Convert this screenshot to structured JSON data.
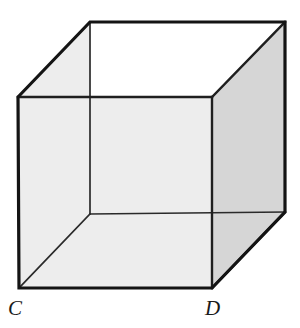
{
  "figure": {
    "name": "transparent-cube-diagram",
    "type": "line-drawing",
    "background_color": "#ffffff",
    "stroke_color": "#1a1a1a",
    "outer_stroke_width": 3,
    "inner_stroke_width": 1.6,
    "faces": {
      "top_face_color": "#ffffff",
      "left_face_color": "#ededed",
      "front_face_color": "#ededed",
      "right_face_color": "#d6d6d6"
    },
    "vertices": {
      "front_top_left": [
        18,
        97
      ],
      "front_top_right": [
        212,
        97
      ],
      "front_bottom_left": [
        19,
        288
      ],
      "front_bottom_right": [
        212,
        288
      ],
      "back_top_left": [
        90,
        22
      ],
      "back_top_right": [
        285,
        22
      ],
      "back_bottom_left": [
        90,
        214
      ],
      "back_bottom_right": [
        285,
        212
      ]
    },
    "outline_path": "M18,97 L90,22 L285,22 L285,212 L212,288 L19,288 Z",
    "right_face_path": "M212,97 L285,22 L285,212 L212,288 Z",
    "left_face_path": "M18,97 L90,22 L90,214 L19,288 Z",
    "front_face_path": "M18,97 L212,97 L212,288 L19,288 Z",
    "top_face_path": "M18,97 L90,22 L285,22 L212,97 Z",
    "hidden_edges": [
      {
        "name": "back-vertical-left",
        "from": [
          90,
          22
        ],
        "to": [
          90,
          214
        ]
      },
      {
        "name": "back-bottom-horizontal",
        "from": [
          90,
          214
        ],
        "to": [
          285,
          212
        ]
      },
      {
        "name": "back-bottom-left-diagonal",
        "from": [
          90,
          214
        ],
        "to": [
          19,
          288
        ]
      },
      {
        "name": "front-top-horizontal",
        "from": [
          18,
          97
        ],
        "to": [
          212,
          97
        ]
      },
      {
        "name": "front-right-vertical",
        "from": [
          212,
          97
        ],
        "to": [
          212,
          288
        ]
      },
      {
        "name": "top-right-diagonal",
        "from": [
          212,
          97
        ],
        "to": [
          285,
          22
        ]
      },
      {
        "name": "bottom-right-diagonal",
        "from": [
          212,
          288
        ],
        "to": [
          285,
          212
        ]
      }
    ],
    "labels": {
      "bottom_left": "C",
      "bottom_right": "D"
    }
  }
}
